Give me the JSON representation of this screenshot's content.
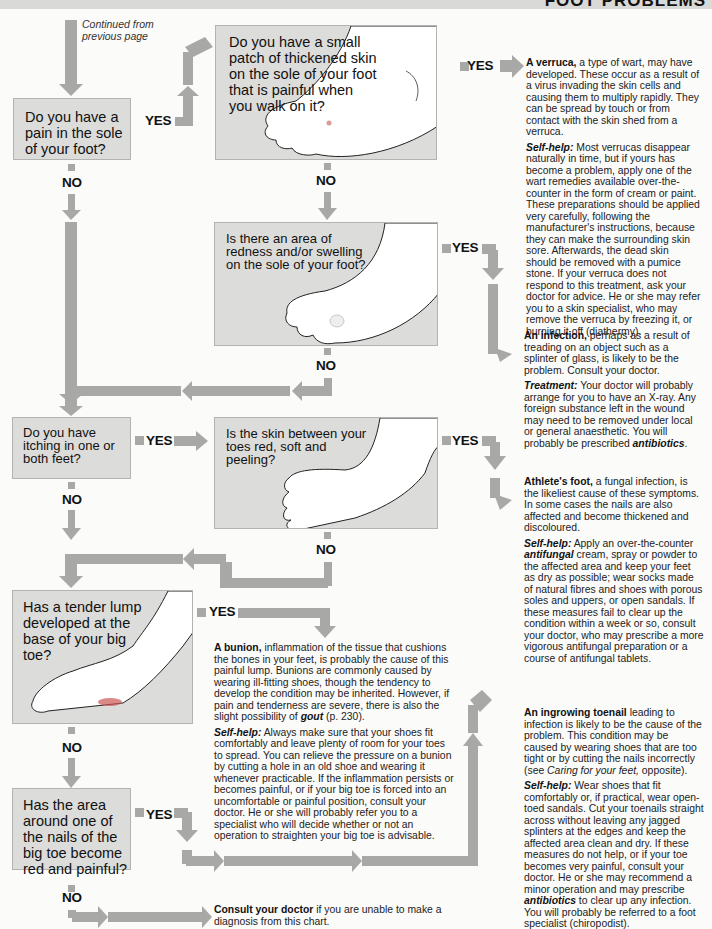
{
  "header": {
    "title": "FOOT PROBLEMS"
  },
  "continued": {
    "line1": "Continued from",
    "line2": "previous page"
  },
  "labels": {
    "yes": "YES",
    "no": "NO"
  },
  "colors": {
    "box_fill": "#dcdcda",
    "box_border": "#b3b3b1",
    "arrow": "#a8a8a6",
    "page": "#fbfbfa"
  },
  "questions": {
    "q1": "Do you have a pain in the sole of your foot?",
    "q2": "Do you have a small patch of thickened skin on the sole of your foot that is painful when you walk on it?",
    "q3": "Is there an area of redness and/or swelling on the sole of your foot?",
    "q4": "Do you have itching in one or both feet?",
    "q5": "Is the skin between your toes red, soft and peeling?",
    "q6": "Has a tender lump developed at the base of your big toe?",
    "q7": "Has the area around one of the nails of the big toe become red and painful?"
  },
  "illustrations": {
    "q2": "foot-sole-verruca-icon",
    "q3": "foot-sole-swelling-icon",
    "q5": "foot-toes-icon",
    "q6": "foot-bunion-icon"
  },
  "answers": {
    "verruca": {
      "title": "A verruca,",
      "body": " a type of wart, may have developed. These occur as a result of a virus invading the skin cells and causing them to multiply rapidly. They can be spread by touch or from contact with the skin shed from a verruca.",
      "selfhelp_label": "Self-help:",
      "selfhelp": " Most verrucas disappear naturally in time, but if yours has become a problem, apply one of the wart remedies available over-the-counter in the form of cream or paint. These preparations should be applied very carefully, following the manufacturer's instructions, because they can make the surrounding skin sore. Afterwards, the dead skin should be removed with a pumice stone. If your verruca does not respond to this treatment, ask your doctor for advice. He or she may refer you to a skin specialist, who may remove the verruca by freezing it, or burning it off (diathermy)."
    },
    "infection": {
      "title": "An infection,",
      "body": " perhaps as a result of treading on an object such as a splinter of glass, is likely to be the problem. Consult your doctor.",
      "treatment_label": "Treatment:",
      "treatment": " Your doctor will probably arrange for you to have an X-ray. Any foreign substance left in the wound may need to be removed under local or general anaesthetic. You will probably be prescribed ",
      "treatment_em": "antibiotics",
      "treatment_end": "."
    },
    "athletes_foot": {
      "title": "Athlete's foot,",
      "body": " a fungal infection, is the likeliest cause of these symptoms. In some cases the nails are also affected and become thickened and discoloured.",
      "selfhelp_label": "Self-help:",
      "selfhelp_pre": " Apply an over-the-counter ",
      "selfhelp_em": "antifungal",
      "selfhelp": " cream, spray or powder to the affected area and keep your feet as dry as possible; wear socks made of natural fibres and shoes with porous soles and uppers, or open sandals. If these measures fail to clear up the condition within a week or so, consult your doctor, who may prescribe a more vigorous antifungal preparation or a course of antifungal tablets."
    },
    "bunion": {
      "title": "A bunion,",
      "body": " inflammation of the tissue that cushions the bones in your feet, is probably the cause of this painful lump. Bunions are commonly caused by wearing ill-fitting shoes, though the tendency to develop the condition may be inherited. However, if pain and tenderness are severe, there is also the slight possibility of ",
      "body_em": "gout",
      "body_end": " (p. 230).",
      "selfhelp_label": "Self-help:",
      "selfhelp": " Always make sure that your shoes fit comfortably and leave plenty of room for your toes to spread. You can relieve the pressure on a bunion by cutting a hole in an old shoe and wearing it whenever practicable. If the inflammation persists or becomes painful, or if your big toe is forced into an uncomfortable or painful position, consult your doctor. He or she will probably refer you to a specialist who will decide whether or not an operation to straighten your big toe is advisable."
    },
    "toenail": {
      "title": "An ingrowing toenail",
      "body": " leading to infection is likely to be the cause of the problem. This condition may be caused by wearing shoes that are too tight or by cutting the nails incorrectly (see ",
      "body_em": "Caring for your feet,",
      "body_end": " opposite).",
      "selfhelp_label": "Self-help:",
      "selfhelp": " Wear shoes that fit comfortably or, if practical, wear open-toed sandals. Cut your toenails straight across without leaving any jagged splinters at the edges and keep the affected area clean and dry. If these measures do not help, or if your toe becomes very painful, consult your doctor. He or she may recommend a minor operation and may prescribe ",
      "selfhelp_em": "antibiotics",
      "selfhelp_end": " to clear up any infection. You will probably be referred to a foot specialist (chiropodist)."
    },
    "consult": {
      "title": "Consult your doctor",
      "body": " if you are unable to make a diagnosis from this chart."
    }
  }
}
